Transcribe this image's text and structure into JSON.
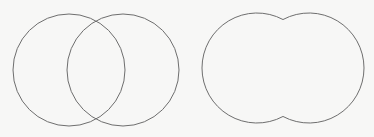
{
  "diagram": {
    "background": "#f7f7f6",
    "stroke_color": "#6e6e6e",
    "stroke_width": 1,
    "panels": [
      {
        "name": "overlapping-circles",
        "type": "two-circles-outline",
        "circles": [
          {
            "cx": 69,
            "cy": 70,
            "r": 56
          },
          {
            "cx": 123,
            "cy": 70,
            "r": 56
          }
        ]
      },
      {
        "name": "union-outline",
        "type": "union-of-two-circles",
        "circles": [
          {
            "cx": 257,
            "cy": 68,
            "r": 55
          },
          {
            "cx": 309,
            "cy": 68,
            "r": 55
          }
        ]
      }
    ]
  }
}
